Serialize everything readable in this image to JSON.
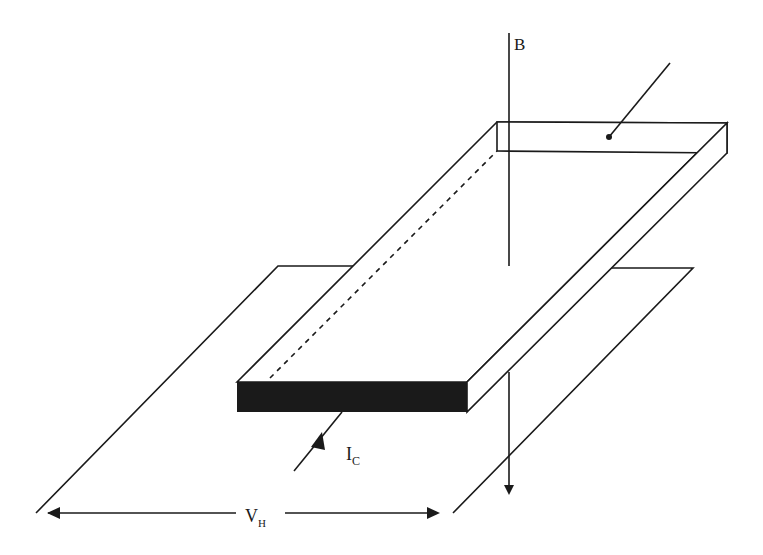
{
  "diagram": {
    "labels": {
      "magnetic_field": "B",
      "control_current_main": "I",
      "control_current_sub": "C",
      "hall_voltage_main": "V",
      "hall_voltage_sub": "H"
    },
    "colors": {
      "line": "#1a1a1a",
      "front_face": "#1a1a1a",
      "background": "#ffffff"
    }
  }
}
